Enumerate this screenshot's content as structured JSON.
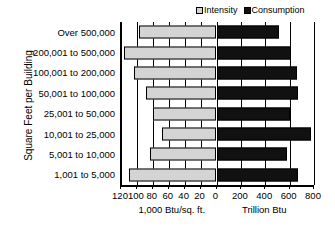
{
  "chart_data": {
    "type": "bar",
    "orientation": "horizontal",
    "subtype": "bidirectional-paired-bar",
    "title": "",
    "ylabel": "Square Feet per Building",
    "categories": [
      "Over 500,000",
      "200,001 to 500,000",
      "100,001 to 200,000",
      "50,001 to 100,000",
      "25,001 to 50,000",
      "10,001 to 25,000",
      "5,001 to 10,000",
      "1,001 to 5,000"
    ],
    "series": [
      {
        "name": "Intensity",
        "axis": "left",
        "unit": "1,000 Btu/sq. ft.",
        "color": "#d4d4d4",
        "values": [
          98,
          116,
          104,
          89,
          80,
          69,
          83,
          110
        ]
      },
      {
        "name": "Consumption",
        "axis": "right",
        "unit": "Trillion Btu",
        "color": "#111111",
        "values": [
          510,
          610,
          660,
          670,
          600,
          775,
          580,
          665
        ]
      }
    ],
    "left_axis": {
      "label": "1,000 Btu/sq. ft.",
      "ticks": [
        120,
        100,
        80,
        60,
        40,
        20,
        0
      ],
      "tick_labels": [
        "120",
        "100",
        "80",
        "60",
        "40",
        "20",
        "0"
      ],
      "range": [
        120,
        0
      ],
      "direction": "right-to-left"
    },
    "right_axis": {
      "label": "Trillion Btu",
      "ticks": [
        0,
        200,
        400,
        600,
        800
      ],
      "tick_labels": [
        "0",
        "200",
        "400",
        "600",
        "800"
      ],
      "range": [
        0,
        800
      ],
      "direction": "left-to-right"
    },
    "grid": true,
    "legend_position": "top-right"
  },
  "legend": {
    "entries": [
      {
        "label": "Intensity",
        "swatch": "intensity-swatch"
      },
      {
        "label": "Consumption",
        "swatch": "consumption-swatch"
      }
    ]
  }
}
